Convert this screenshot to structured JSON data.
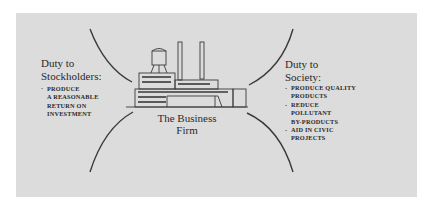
{
  "diagram": {
    "center": {
      "label_line1": "The Business",
      "label_line2": "Firm",
      "icon": "factory-icon"
    },
    "left": {
      "heading_line1": "Duty to",
      "heading_line2": "Stockholders:",
      "items": [
        "PRODUCE",
        "A REASONABLE",
        "RETURN ON",
        "INVESTMENT"
      ]
    },
    "right": {
      "heading_line1": "Duty to",
      "heading_line2": "Society:",
      "items": [
        {
          "line1": "PRODUCE QUALITY",
          "line2": "PRODUCTS"
        },
        {
          "line1": "REDUCE",
          "line2": "POLLUTANT",
          "line3": "BY-PRODUCTS"
        },
        {
          "line1": "AID IN CIVIC",
          "line2": "PROJECTS"
        }
      ]
    },
    "colors": {
      "background": "#dcdcdc",
      "ink": "#2a2a2a"
    }
  }
}
